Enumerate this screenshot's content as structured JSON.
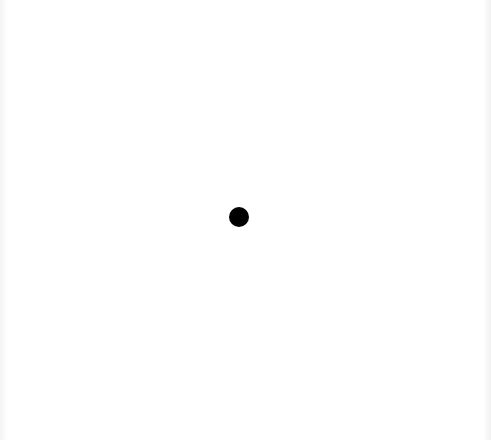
{
  "canvas": {
    "width": 491,
    "height": 440,
    "background": "#ffffff"
  },
  "dot": {
    "shape": "filled-circle",
    "center_x": 239,
    "center_y": 217,
    "diameter": 20,
    "color": "#000000"
  }
}
